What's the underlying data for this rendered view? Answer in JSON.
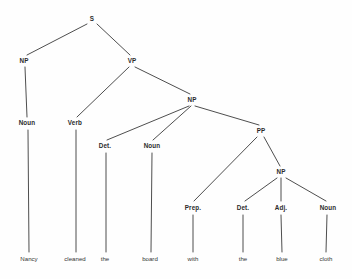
{
  "diagram": {
    "sentence": "Nancy cleaned the board with the blue cloth",
    "style": {
      "background_color": "#fefefe",
      "line_color": "#3a3a3a",
      "node_text_color": "#2b2b2b",
      "word_text_color": "#333333",
      "line_width": 0.9
    },
    "nodes": [
      {
        "id": "S",
        "label": "S",
        "x": 92,
        "y": 19
      },
      {
        "id": "NP1",
        "label": "NP",
        "x": 24,
        "y": 61
      },
      {
        "id": "VP",
        "label": "VP",
        "x": 132,
        "y": 61
      },
      {
        "id": "NP2",
        "label": "NP",
        "x": 192,
        "y": 100
      },
      {
        "id": "PP",
        "label": "PP",
        "x": 261,
        "y": 131
      },
      {
        "id": "NP3",
        "label": "NP",
        "x": 281,
        "y": 172
      },
      {
        "id": "Noun1",
        "label": "Noun",
        "x": 27,
        "y": 123
      },
      {
        "id": "Verb",
        "label": "Verb",
        "x": 75,
        "y": 123
      },
      {
        "id": "Det1",
        "label": "Det.",
        "x": 105,
        "y": 146
      },
      {
        "id": "Noun2",
        "label": "Noun",
        "x": 152,
        "y": 146
      },
      {
        "id": "Prep",
        "label": "Prep.",
        "x": 193,
        "y": 208
      },
      {
        "id": "Det2",
        "label": "Det.",
        "x": 243,
        "y": 208
      },
      {
        "id": "Adj",
        "label": "Adj.",
        "x": 281,
        "y": 208
      },
      {
        "id": "Noun3",
        "label": "Noun",
        "x": 328,
        "y": 208
      }
    ],
    "words": [
      {
        "id": "w-nancy",
        "label": "Nancy",
        "x": 29,
        "y": 259,
        "parent": "Noun1"
      },
      {
        "id": "w-cleaned",
        "label": "cleaned",
        "x": 75,
        "y": 259,
        "parent": "Verb"
      },
      {
        "id": "w-the1",
        "label": "the",
        "x": 105,
        "y": 259,
        "parent": "Det1"
      },
      {
        "id": "w-board",
        "label": "board",
        "x": 150,
        "y": 259,
        "parent": "Noun2"
      },
      {
        "id": "w-with",
        "label": "with",
        "x": 193,
        "y": 259,
        "parent": "Prep"
      },
      {
        "id": "w-the2",
        "label": "the",
        "x": 243,
        "y": 259,
        "parent": "Det2"
      },
      {
        "id": "w-blue",
        "label": "blue",
        "x": 282,
        "y": 259,
        "parent": "Adj"
      },
      {
        "id": "w-cloth",
        "label": "cloth",
        "x": 326,
        "y": 259,
        "parent": "Noun3"
      }
    ],
    "edges": [
      {
        "from": "S",
        "to": "NP1",
        "x1": 87,
        "y1": 24,
        "x2": 27,
        "y2": 55
      },
      {
        "from": "S",
        "to": "VP",
        "x1": 97,
        "y1": 24,
        "x2": 130,
        "y2": 55
      },
      {
        "from": "NP1",
        "to": "Noun1",
        "x1": 25,
        "y1": 67,
        "x2": 27,
        "y2": 117
      },
      {
        "from": "VP",
        "to": "Verb",
        "x1": 129,
        "y1": 67,
        "x2": 77,
        "y2": 117
      },
      {
        "from": "VP",
        "to": "NP2",
        "x1": 135,
        "y1": 67,
        "x2": 190,
        "y2": 94
      },
      {
        "from": "NP2",
        "to": "Det1",
        "x1": 189,
        "y1": 106,
        "x2": 107,
        "y2": 140
      },
      {
        "from": "NP2",
        "to": "Noun2",
        "x1": 191,
        "y1": 106,
        "x2": 153,
        "y2": 140
      },
      {
        "from": "NP2",
        "to": "PP",
        "x1": 195,
        "y1": 106,
        "x2": 259,
        "y2": 125
      },
      {
        "from": "PP",
        "to": "Prep",
        "x1": 257,
        "y1": 137,
        "x2": 194,
        "y2": 201
      },
      {
        "from": "PP",
        "to": "NP3",
        "x1": 264,
        "y1": 137,
        "x2": 280,
        "y2": 166
      },
      {
        "from": "NP3",
        "to": "Det2",
        "x1": 277,
        "y1": 178,
        "x2": 245,
        "y2": 201
      },
      {
        "from": "NP3",
        "to": "Adj",
        "x1": 281,
        "y1": 178,
        "x2": 281,
        "y2": 201
      },
      {
        "from": "NP3",
        "to": "Noun3",
        "x1": 286,
        "y1": 178,
        "x2": 326,
        "y2": 201
      },
      {
        "from": "Noun1",
        "to": "w-nancy",
        "x1": 28,
        "y1": 130,
        "x2": 29,
        "y2": 252
      },
      {
        "from": "Verb",
        "to": "w-cleaned",
        "x1": 76,
        "y1": 130,
        "x2": 76,
        "y2": 252
      },
      {
        "from": "Det1",
        "to": "w-the1",
        "x1": 106,
        "y1": 153,
        "x2": 106,
        "y2": 252
      },
      {
        "from": "Noun2",
        "to": "w-board",
        "x1": 152,
        "y1": 153,
        "x2": 151,
        "y2": 252
      },
      {
        "from": "Prep",
        "to": "w-with",
        "x1": 193,
        "y1": 215,
        "x2": 193,
        "y2": 252
      },
      {
        "from": "Det2",
        "to": "w-the2",
        "x1": 243,
        "y1": 215,
        "x2": 243,
        "y2": 252
      },
      {
        "from": "Adj",
        "to": "w-blue",
        "x1": 281,
        "y1": 215,
        "x2": 282,
        "y2": 252
      },
      {
        "from": "Noun3",
        "to": "w-cloth",
        "x1": 327,
        "y1": 215,
        "x2": 326,
        "y2": 252
      }
    ]
  }
}
